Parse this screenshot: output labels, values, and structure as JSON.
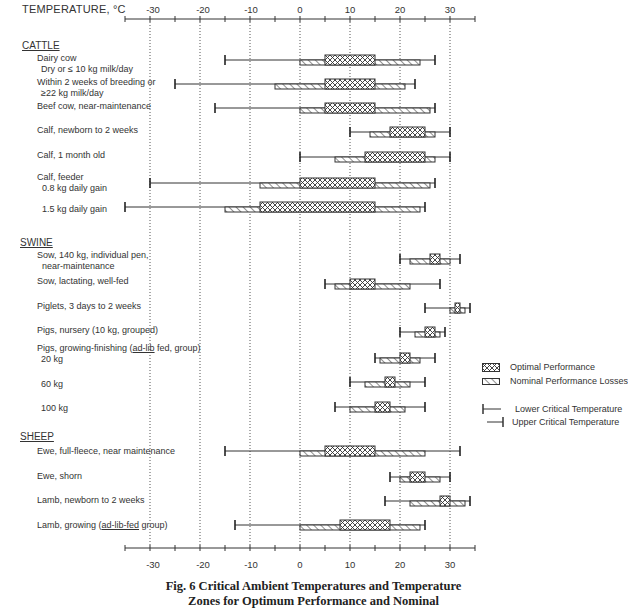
{
  "header": {
    "axis_title": "TEMPERATURE, °C"
  },
  "axis": {
    "ticks": [
      "-30",
      "-20",
      "-10",
      "0",
      "10",
      "20",
      "30"
    ],
    "tick_values": [
      -30,
      -20,
      -10,
      0,
      10,
      20,
      30
    ]
  },
  "groups": [
    {
      "title": "CATTLE"
    },
    {
      "title": "SWINE"
    },
    {
      "title": "SHEEP"
    }
  ],
  "rows": [
    {
      "line1": "Dairy cow",
      "line2": "Dry or  ≤ 10 kg milk/day"
    },
    {
      "line1": "Within 2 weeks of breeding or",
      "line2": "≥22 kg milk/day"
    },
    {
      "line1": "Beef cow, near-maintenance",
      "line2": ""
    },
    {
      "line1": "Calf, newborn to 2 weeks",
      "line2": ""
    },
    {
      "line1": "Calf, 1 month old",
      "line2": ""
    },
    {
      "line1": "Calf, feeder",
      "line2": "0.8 kg daily gain"
    },
    {
      "line1": "1.5 kg daily gain",
      "line2": ""
    },
    {
      "line1": "Sow, 140 kg, individual pen,",
      "line2": "near-maintenance"
    },
    {
      "line1": "Sow, lactating, well-fed",
      "line2": ""
    },
    {
      "line1": "Piglets, 3 days to 2 weeks",
      "line2": ""
    },
    {
      "line1": "Pigs, nursery (10 kg, grouped)",
      "line2": ""
    },
    {
      "line1_pre": "Pigs, growing-finishing (",
      "line1_u": "ad-lib",
      "line1_post": " fed, group)",
      "line2": "20 kg"
    },
    {
      "line1": "60 kg",
      "line2": ""
    },
    {
      "line1": "100 kg",
      "line2": ""
    },
    {
      "line1": "Ewe, full-fleece, near maintenance",
      "line2": ""
    },
    {
      "line1": "Ewe, shorn",
      "line2": ""
    },
    {
      "line1": "Lamb, newborn to 2 weeks",
      "line2": ""
    },
    {
      "line1_pre": "Lamb, growing (",
      "line1_u": "ad-lib-fed",
      "line1_post": " group)",
      "line2": ""
    }
  ],
  "legend": {
    "optimal": "Optimal Performance",
    "nominal": "Nominal Performance Losses",
    "lower": "Lower Critical Temperature",
    "upper": "Upper Critical Temperature"
  },
  "caption": {
    "line1": "Fig. 6   Critical Ambient Temperatures and Temperature",
    "line2": "Zones for Optimum Performance and Nominal"
  },
  "chart_data": {
    "type": "range-bar",
    "title": "Fig. 6 Critical Ambient Temperatures and Temperature Zones for Optimum Performance and Nominal",
    "xlabel": "TEMPERATURE, °C",
    "xlim": [
      -35,
      35
    ],
    "xticks": [
      -30,
      -20,
      -10,
      0,
      10,
      20,
      30
    ],
    "grid": "vertical dotted at every 10°C",
    "legend": [
      "Optimal Performance",
      "Nominal Performance Losses",
      "Lower Critical Temperature",
      "Upper Critical Temperature"
    ],
    "legend_position": "right",
    "series_fields": [
      "lower_critical",
      "nominal_low",
      "optimal_low",
      "optimal_high",
      "nominal_high",
      "upper_critical"
    ],
    "categories": [
      {
        "group": "CATTLE",
        "name": "Dairy cow, Dry or ≤ 10 kg milk/day",
        "lower_critical": -15,
        "nominal_low": 0,
        "optimal_low": 5,
        "optimal_high": 15,
        "nominal_high": 24,
        "upper_critical": 27
      },
      {
        "group": "CATTLE",
        "name": "Within 2 weeks of breeding or ≥22 kg milk/day",
        "lower_critical": -25,
        "nominal_low": -5,
        "optimal_low": 5,
        "optimal_high": 15,
        "nominal_high": 21,
        "upper_critical": 23
      },
      {
        "group": "CATTLE",
        "name": "Beef cow, near-maintenance",
        "lower_critical": -17,
        "nominal_low": 0,
        "optimal_low": 5,
        "optimal_high": 15,
        "nominal_high": 26,
        "upper_critical": 27
      },
      {
        "group": "CATTLE",
        "name": "Calf, newborn to 2 weeks",
        "lower_critical": 10,
        "nominal_low": 14,
        "optimal_low": 18,
        "optimal_high": 25,
        "nominal_high": 27,
        "upper_critical": 30
      },
      {
        "group": "CATTLE",
        "name": "Calf, 1 month old",
        "lower_critical": 0,
        "nominal_low": 7,
        "optimal_low": 13,
        "optimal_high": 25,
        "nominal_high": 27,
        "upper_critical": 30
      },
      {
        "group": "CATTLE",
        "name": "Calf, feeder, 0.8 kg daily gain",
        "lower_critical": -30,
        "nominal_low": -8,
        "optimal_low": 0,
        "optimal_high": 15,
        "nominal_high": 26,
        "upper_critical": 27
      },
      {
        "group": "CATTLE",
        "name": "Calf, feeder, 1.5 kg daily gain",
        "lower_critical": -35,
        "nominal_low": -15,
        "optimal_low": -8,
        "optimal_high": 15,
        "nominal_high": 24,
        "upper_critical": 25
      },
      {
        "group": "SWINE",
        "name": "Sow, 140 kg, individual pen, near-maintenance",
        "lower_critical": 20,
        "nominal_low": 22,
        "optimal_low": 26,
        "optimal_high": 28,
        "nominal_high": 30,
        "upper_critical": 32
      },
      {
        "group": "SWINE",
        "name": "Sow, lactating, well-fed",
        "lower_critical": 5,
        "nominal_low": 7,
        "optimal_low": 10,
        "optimal_high": 15,
        "nominal_high": 22,
        "upper_critical": 28
      },
      {
        "group": "SWINE",
        "name": "Piglets, 3 days to 2 weeks",
        "lower_critical": 25,
        "nominal_low": 30,
        "optimal_low": 31,
        "optimal_high": 32,
        "nominal_high": 33,
        "upper_critical": 34
      },
      {
        "group": "SWINE",
        "name": "Pigs, nursery (10 kg, grouped)",
        "lower_critical": 20,
        "nominal_low": 23,
        "optimal_low": 25,
        "optimal_high": 27,
        "nominal_high": 28,
        "upper_critical": 29
      },
      {
        "group": "SWINE",
        "name": "Pigs, growing-finishing (ad-lib fed, group) 20 kg",
        "lower_critical": 15,
        "nominal_low": 16,
        "optimal_low": 20,
        "optimal_high": 22,
        "nominal_high": 24,
        "upper_critical": 27
      },
      {
        "group": "SWINE",
        "name": "60 kg",
        "lower_critical": 10,
        "nominal_low": 13,
        "optimal_low": 17,
        "optimal_high": 19,
        "nominal_high": 22,
        "upper_critical": 25
      },
      {
        "group": "SWINE",
        "name": "100 kg",
        "lower_critical": 7,
        "nominal_low": 10,
        "optimal_low": 15,
        "optimal_high": 18,
        "nominal_high": 21,
        "upper_critical": 25
      },
      {
        "group": "SHEEP",
        "name": "Ewe, full-fleece, near maintenance",
        "lower_critical": -15,
        "nominal_low": 0,
        "optimal_low": 5,
        "optimal_high": 15,
        "nominal_high": 25,
        "upper_critical": 32
      },
      {
        "group": "SHEEP",
        "name": "Ewe, shorn",
        "lower_critical": 18,
        "nominal_low": 20,
        "optimal_low": 22,
        "optimal_high": 25,
        "nominal_high": 28,
        "upper_critical": 30
      },
      {
        "group": "SHEEP",
        "name": "Lamb, newborn to 2 weeks",
        "lower_critical": 17,
        "nominal_low": 22,
        "optimal_low": 28,
        "optimal_high": 30,
        "nominal_high": 33,
        "upper_critical": 34
      },
      {
        "group": "SHEEP",
        "name": "Lamb, growing (ad-lib-fed group)",
        "lower_critical": -13,
        "nominal_low": 0,
        "optimal_low": 8,
        "optimal_high": 18,
        "nominal_high": 24,
        "upper_critical": 25
      }
    ]
  }
}
